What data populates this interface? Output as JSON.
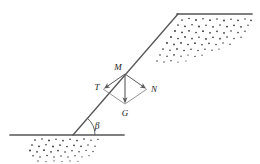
{
  "figure": {
    "name": "slope-free-body-diagram",
    "background_color": "#ffffff",
    "line_color": "#555555",
    "vector_color": "#666666",
    "text_color": "#1a1a1a",
    "stipple_color": "#2b2b2b",
    "width": 260,
    "height": 164
  },
  "labels": {
    "point_m": "M",
    "vector_t": "T",
    "vector_n": "N",
    "vector_g": "G",
    "angle_beta": "β"
  },
  "geometry": {
    "slope": {
      "x1": 73,
      "y1": 135,
      "x2": 178,
      "y2": 14
    },
    "ground_lower": {
      "x1": 10,
      "y1": 135,
      "x2": 124,
      "y2": 135
    },
    "ground_upper": {
      "x1": 178,
      "y1": 14,
      "x2": 252,
      "y2": 14
    },
    "point_m": {
      "x": 125,
      "y": 74
    },
    "point_t": {
      "x": 103,
      "y": 89
    },
    "point_n": {
      "x": 147,
      "y": 89
    },
    "point_g": {
      "x": 125,
      "y": 104
    },
    "angle_beta_degrees": 49
  },
  "stipple_regions": {
    "upper_fill": {
      "label": "upper-soil-fill",
      "dot_count": 120
    },
    "lower_fill": {
      "label": "lower-soil-fill",
      "dot_count": 95
    }
  }
}
